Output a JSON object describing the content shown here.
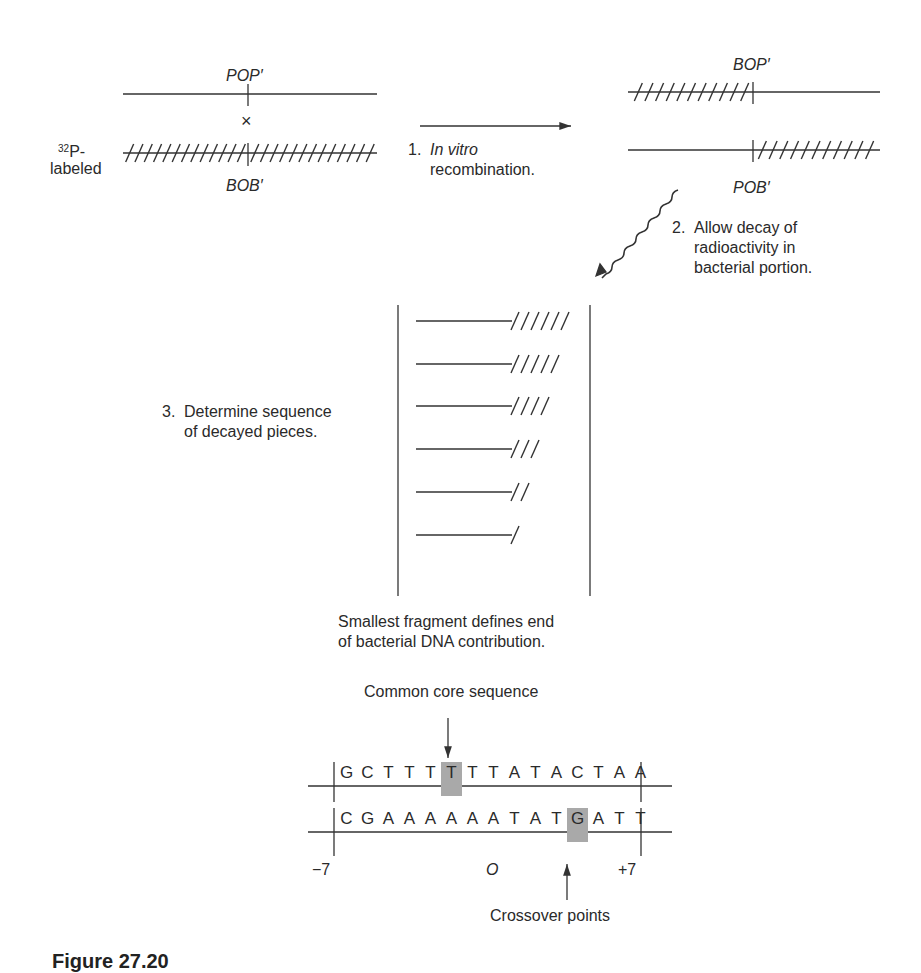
{
  "top_left": {
    "upper_label": "POP′",
    "cross_symbol": "×",
    "lower_label": "BOB′",
    "radiolabel_sup": "32",
    "radiolabel_text": "P-",
    "radiolabel_text2": "labeled"
  },
  "top_right": {
    "upper_label": "BOP′",
    "lower_label": "POB′"
  },
  "steps": [
    {
      "number": "1.",
      "line1_italic": "In vitro",
      "line2": "recombination."
    },
    {
      "number": "2.",
      "line1": "Allow decay of",
      "line2": "radioactivity in",
      "line3": "bacterial portion."
    },
    {
      "number": "3.",
      "line1": "Determine sequence",
      "line2": "of decayed pieces."
    }
  ],
  "fragments": {
    "hatch_counts": [
      6,
      5,
      4,
      3,
      2,
      1
    ],
    "note_line1": "Smallest fragment defines end",
    "note_line2": "of bacterial DNA contribution."
  },
  "core": {
    "title": "Common core sequence",
    "top_strand": [
      "G",
      "C",
      "T",
      "T",
      "T",
      "T",
      "T",
      "T",
      "A",
      "T",
      "A",
      "C",
      "T",
      "A",
      "A"
    ],
    "top_highlight_index": 5,
    "bottom_strand": [
      "C",
      "G",
      "A",
      "A",
      "A",
      "A",
      "A",
      "A",
      "T",
      "A",
      "T",
      "G",
      "A",
      "T",
      "T"
    ],
    "bottom_highlight_index": 11,
    "pos_left": "−7",
    "pos_center": "O",
    "pos_right": "+7",
    "crossover_label": "Crossover points",
    "highlight_color": "#a9a9a9"
  },
  "caption": "Figure 27.20"
}
